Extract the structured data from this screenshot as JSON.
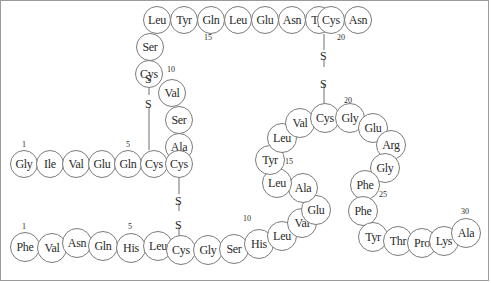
{
  "diagram": {
    "colors": {
      "circle_stroke": "#7b7b7b",
      "text": "#2b2b2b",
      "bond_line": "#6f6f6f",
      "frame": "#9a9a9a",
      "background": "#ffffff"
    },
    "residues": [
      {
        "label": "Leu",
        "x": 143,
        "y": 6,
        "d": 28,
        "fs": 12
      },
      {
        "label": "Tyr",
        "x": 170,
        "y": 6,
        "d": 28,
        "fs": 12
      },
      {
        "label": "Gln",
        "x": 197,
        "y": 6,
        "d": 28,
        "fs": 12
      },
      {
        "label": "Leu",
        "x": 224,
        "y": 6,
        "d": 28,
        "fs": 12
      },
      {
        "label": "Glu",
        "x": 251,
        "y": 6,
        "d": 28,
        "fs": 12
      },
      {
        "label": "Asn",
        "x": 278,
        "y": 6,
        "d": 28,
        "fs": 12
      },
      {
        "label": "Tyr",
        "x": 305,
        "y": 6,
        "d": 28,
        "fs": 12
      },
      {
        "label": "Cys",
        "x": 317,
        "y": 6,
        "d": 28,
        "fs": 12
      },
      {
        "label": "Asn",
        "x": 344,
        "y": 6,
        "d": 28,
        "fs": 12
      },
      {
        "label": "Ser",
        "x": 136,
        "y": 33,
        "d": 28,
        "fs": 12
      },
      {
        "label": "Cys",
        "x": 135,
        "y": 60,
        "d": 28,
        "fs": 12
      },
      {
        "label": "Val",
        "x": 158,
        "y": 79,
        "d": 28,
        "fs": 12
      },
      {
        "label": "Ser",
        "x": 165,
        "y": 106,
        "d": 28,
        "fs": 12
      },
      {
        "label": "Ala",
        "x": 165,
        "y": 133,
        "d": 28,
        "fs": 12
      },
      {
        "label": "Gly",
        "x": 10,
        "y": 150,
        "d": 28,
        "fs": 12
      },
      {
        "label": "Ile",
        "x": 36,
        "y": 150,
        "d": 28,
        "fs": 12
      },
      {
        "label": "Val",
        "x": 62,
        "y": 150,
        "d": 28,
        "fs": 12
      },
      {
        "label": "Glu",
        "x": 88,
        "y": 150,
        "d": 28,
        "fs": 12
      },
      {
        "label": "Gln",
        "x": 114,
        "y": 150,
        "d": 28,
        "fs": 12
      },
      {
        "label": "Cys",
        "x": 140,
        "y": 150,
        "d": 28,
        "fs": 12
      },
      {
        "label": "Cys",
        "x": 165,
        "y": 150,
        "d": 28,
        "fs": 12
      },
      {
        "label": "Phe",
        "x": 10,
        "y": 232,
        "d": 30,
        "fs": 12
      },
      {
        "label": "Val",
        "x": 37,
        "y": 233,
        "d": 30,
        "fs": 12
      },
      {
        "label": "Asn",
        "x": 62,
        "y": 228,
        "d": 30,
        "fs": 12
      },
      {
        "label": "Gln",
        "x": 88,
        "y": 231,
        "d": 30,
        "fs": 12
      },
      {
        "label": "His",
        "x": 116,
        "y": 233,
        "d": 30,
        "fs": 12
      },
      {
        "label": "Leu",
        "x": 143,
        "y": 231,
        "d": 30,
        "fs": 12
      },
      {
        "label": "Cys",
        "x": 166,
        "y": 235,
        "d": 30,
        "fs": 12
      },
      {
        "label": "Gly",
        "x": 193,
        "y": 235,
        "d": 30,
        "fs": 12
      },
      {
        "label": "Ser",
        "x": 219,
        "y": 234,
        "d": 30,
        "fs": 12
      },
      {
        "label": "His",
        "x": 244,
        "y": 229,
        "d": 30,
        "fs": 12
      },
      {
        "label": "Leu",
        "x": 267,
        "y": 221,
        "d": 30,
        "fs": 12
      },
      {
        "label": "Val",
        "x": 287,
        "y": 208,
        "d": 30,
        "fs": 12
      },
      {
        "label": "Glu",
        "x": 301,
        "y": 195,
        "d": 30,
        "fs": 12
      },
      {
        "label": "Ala",
        "x": 288,
        "y": 173,
        "d": 30,
        "fs": 12
      },
      {
        "label": "Leu",
        "x": 262,
        "y": 168,
        "d": 30,
        "fs": 12
      },
      {
        "label": "Tyr",
        "x": 255,
        "y": 145,
        "d": 30,
        "fs": 12
      },
      {
        "label": "Leu",
        "x": 267,
        "y": 123,
        "d": 30,
        "fs": 12
      },
      {
        "label": "Val",
        "x": 285,
        "y": 108,
        "d": 30,
        "fs": 12
      },
      {
        "label": "Cys",
        "x": 310,
        "y": 103,
        "d": 30,
        "fs": 12
      },
      {
        "label": "Gly",
        "x": 335,
        "y": 103,
        "d": 30,
        "fs": 12
      },
      {
        "label": "Glu",
        "x": 358,
        "y": 113,
        "d": 30,
        "fs": 12
      },
      {
        "label": "Arg",
        "x": 376,
        "y": 130,
        "d": 30,
        "fs": 12
      },
      {
        "label": "Gly",
        "x": 370,
        "y": 153,
        "d": 30,
        "fs": 12
      },
      {
        "label": "Phe",
        "x": 350,
        "y": 170,
        "d": 30,
        "fs": 12
      },
      {
        "label": "Phe",
        "x": 348,
        "y": 196,
        "d": 30,
        "fs": 12
      },
      {
        "label": "Tyr",
        "x": 358,
        "y": 222,
        "d": 30,
        "fs": 12
      },
      {
        "label": "Thr",
        "x": 383,
        "y": 226,
        "d": 30,
        "fs": 12
      },
      {
        "label": "Pro",
        "x": 407,
        "y": 228,
        "d": 30,
        "fs": 12
      },
      {
        "label": "Lys",
        "x": 429,
        "y": 226,
        "d": 30,
        "fs": 12
      },
      {
        "label": "Ala",
        "x": 451,
        "y": 218,
        "d": 30,
        "fs": 12
      }
    ],
    "number_labels": [
      {
        "text": "15",
        "x": 204,
        "y": 33,
        "fs": 8
      },
      {
        "text": "20",
        "x": 337,
        "y": 33,
        "fs": 8
      },
      {
        "text": "10",
        "x": 167,
        "y": 65,
        "fs": 8
      },
      {
        "text": "20",
        "x": 344,
        "y": 96,
        "fs": 8
      },
      {
        "text": "1",
        "x": 22,
        "y": 140,
        "fs": 8
      },
      {
        "text": "5",
        "x": 126,
        "y": 140,
        "fs": 8
      },
      {
        "text": "15",
        "x": 285,
        "y": 157,
        "fs": 8
      },
      {
        "text": "25",
        "x": 379,
        "y": 190,
        "fs": 8
      },
      {
        "text": "1",
        "x": 22,
        "y": 222,
        "fs": 8
      },
      {
        "text": "5",
        "x": 128,
        "y": 222,
        "fs": 8
      },
      {
        "text": "10",
        "x": 243,
        "y": 214,
        "fs": 8
      },
      {
        "text": "30",
        "x": 461,
        "y": 207,
        "fs": 8
      }
    ],
    "sulfur_labels": [
      {
        "text": "S",
        "x": 145,
        "y": 73,
        "fs": 12
      },
      {
        "text": "S",
        "x": 145,
        "y": 98,
        "fs": 12
      },
      {
        "text": "S",
        "x": 175,
        "y": 195,
        "fs": 12
      },
      {
        "text": "S",
        "x": 175,
        "y": 219,
        "fs": 12
      },
      {
        "text": "S",
        "x": 320,
        "y": 50,
        "fs": 12
      },
      {
        "text": "S",
        "x": 320,
        "y": 78,
        "fs": 12
      }
    ],
    "bonds": [
      {
        "x1": 149,
        "y1": 74,
        "x2": 149,
        "y2": 80
      },
      {
        "x1": 149,
        "y1": 88,
        "x2": 149,
        "y2": 95
      },
      {
        "x1": 149,
        "y1": 107,
        "x2": 149,
        "y2": 150
      },
      {
        "x1": 179,
        "y1": 178,
        "x2": 179,
        "y2": 194
      },
      {
        "x1": 179,
        "y1": 203,
        "x2": 179,
        "y2": 211
      },
      {
        "x1": 179,
        "y1": 227,
        "x2": 179,
        "y2": 236
      },
      {
        "x1": 324,
        "y1": 34,
        "x2": 324,
        "y2": 50
      },
      {
        "x1": 324,
        "y1": 59,
        "x2": 324,
        "y2": 67
      },
      {
        "x1": 324,
        "y1": 84,
        "x2": 324,
        "y2": 104
      }
    ]
  }
}
